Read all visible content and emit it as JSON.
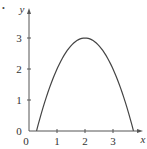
{
  "marker": "•",
  "chart_data": {
    "type": "line",
    "title": "",
    "xlabel": "x",
    "ylabel": "y",
    "xlim": [
      0,
      4
    ],
    "ylim": [
      0,
      3.4
    ],
    "grid": false,
    "x_ticks": [
      "0",
      "1",
      "2",
      "3"
    ],
    "y_ticks": [
      "0",
      "1",
      "2",
      "3"
    ],
    "series": [
      {
        "name": "y = 3 - (x - 2)^2",
        "x": [
          0.27,
          0.5,
          1.0,
          1.5,
          2.0,
          2.5,
          3.0,
          3.5,
          3.73
        ],
        "y": [
          0.0,
          0.75,
          2.0,
          2.75,
          3.0,
          2.75,
          2.0,
          0.75,
          0.0
        ]
      }
    ],
    "color": "#444444"
  }
}
